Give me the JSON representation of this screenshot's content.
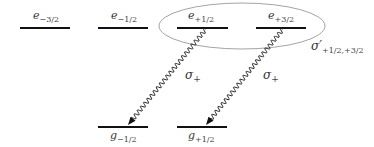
{
  "diagram": {
    "excited_levels": [
      {
        "symbol": "e",
        "sub": "−3/2",
        "x1": 20,
        "x2": 70,
        "y": 28,
        "label_x": 33
      },
      {
        "symbol": "e",
        "sub": "−1/2",
        "x1": 98,
        "x2": 148,
        "y": 28,
        "label_x": 111
      },
      {
        "symbol": "e",
        "sub": "+1/2",
        "x1": 177,
        "x2": 228,
        "y": 28,
        "label_x": 188
      },
      {
        "symbol": "e",
        "sub": "+3/2",
        "x1": 256,
        "x2": 306,
        "y": 28,
        "label_x": 268
      }
    ],
    "ground_levels": [
      {
        "symbol": "g",
        "sub": "−1/2",
        "x1": 98,
        "x2": 148,
        "y": 127,
        "label_x": 110
      },
      {
        "symbol": "g",
        "sub": "+1/2",
        "x1": 177,
        "x2": 227,
        "y": 127,
        "label_x": 188
      }
    ],
    "transitions": [
      {
        "from": "e+1/2",
        "to": "g-1/2",
        "label_symbol": "σ",
        "label_sub": "+",
        "x1": 206,
        "y1": 29,
        "x2": 128,
        "y2": 125,
        "label_x": 185,
        "label_y": 79
      },
      {
        "from": "e+3/2",
        "to": "g+1/2",
        "label_symbol": "σ",
        "label_sub": "+",
        "x1": 283,
        "y1": 29,
        "x2": 206,
        "y2": 125,
        "label_x": 263,
        "label_y": 79
      }
    ],
    "coherence": {
      "symbol": "σ′",
      "sub": "+1/2,+3/2",
      "ellipse": {
        "cx": 242,
        "cy": 26,
        "rx": 83,
        "ry": 23
      }
    }
  }
}
